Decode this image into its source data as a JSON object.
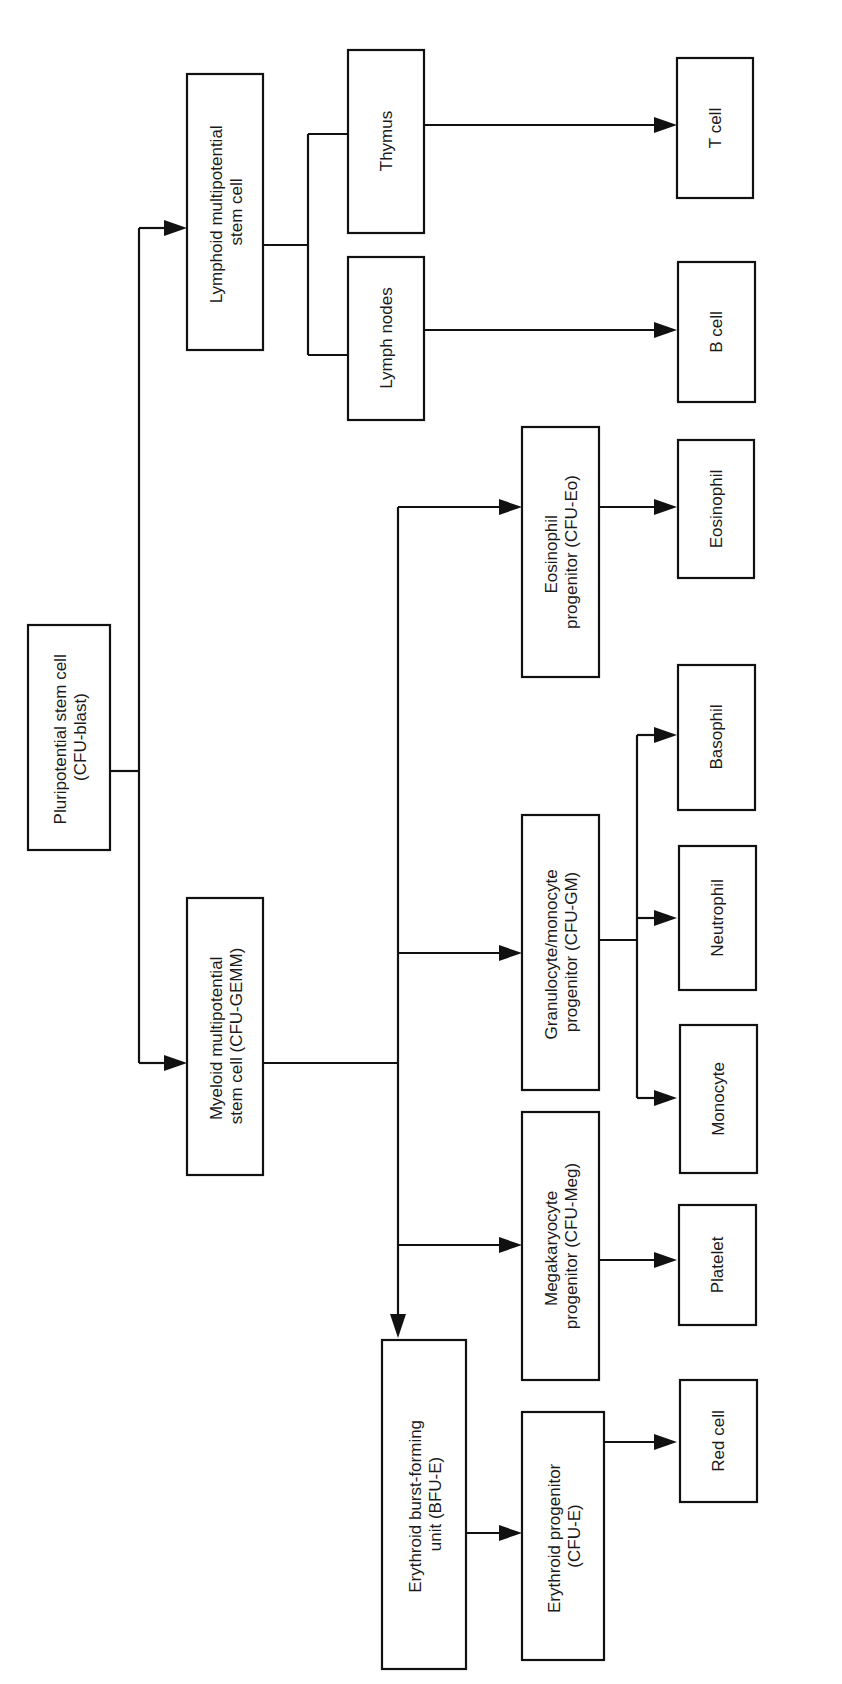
{
  "diagram": {
    "orientation": "rotated-90-ccw",
    "line_color": "#111111",
    "background": "#ffffff",
    "nodes": {
      "pluripotential": {
        "line1": "Pluripotential stem cell",
        "line2": "(CFU-blast)"
      },
      "lymphoid": {
        "line1": "Lymphoid multipotential",
        "line2": "stem cell"
      },
      "myeloid": {
        "line1": "Myeloid multipotential",
        "line2": "stem cell (CFU-GEMM)"
      },
      "thymus": {
        "line1": "Thymus"
      },
      "lymph_nodes": {
        "line1": "Lymph nodes"
      },
      "eosinophil_progenitor": {
        "line1": "Eosinophil",
        "line2": "progenitor (CFU-Eo)"
      },
      "granulocyte_monocyte_progenitor": {
        "line1": "Granulocyte/monocyte",
        "line2": "progenitor (CFU-GM)"
      },
      "megakaryocyte_progenitor": {
        "line1": "Megakaryocyte",
        "line2": "progenitor (CFU-Meg)"
      },
      "bfu_e": {
        "line1": "Erythroid burst-forming",
        "line2": "unit (BFU-E)"
      },
      "cfu_e": {
        "line1": "Erythroid progenitor",
        "line2": "(CFU-E)"
      },
      "t_cell": {
        "line1": "T cell"
      },
      "b_cell": {
        "line1": "B cell"
      },
      "eosinophil": {
        "line1": "Eosinophil"
      },
      "basophil": {
        "line1": "Basophil"
      },
      "neutrophil": {
        "line1": "Neutrophil"
      },
      "monocyte": {
        "line1": "Monocyte"
      },
      "platelet": {
        "line1": "Platelet"
      },
      "red_cell": {
        "line1": "Red cell"
      }
    },
    "edges": [
      [
        "pluripotential",
        "lymphoid"
      ],
      [
        "pluripotential",
        "myeloid"
      ],
      [
        "lymphoid",
        "thymus"
      ],
      [
        "lymphoid",
        "lymph_nodes"
      ],
      [
        "thymus",
        "t_cell"
      ],
      [
        "lymph_nodes",
        "b_cell"
      ],
      [
        "myeloid",
        "eosinophil_progenitor"
      ],
      [
        "myeloid",
        "granulocyte_monocyte_progenitor"
      ],
      [
        "myeloid",
        "megakaryocyte_progenitor"
      ],
      [
        "myeloid",
        "bfu_e"
      ],
      [
        "eosinophil_progenitor",
        "eosinophil"
      ],
      [
        "granulocyte_monocyte_progenitor",
        "basophil"
      ],
      [
        "granulocyte_monocyte_progenitor",
        "neutrophil"
      ],
      [
        "granulocyte_monocyte_progenitor",
        "monocyte"
      ],
      [
        "megakaryocyte_progenitor",
        "platelet"
      ],
      [
        "bfu_e",
        "cfu_e"
      ],
      [
        "cfu_e",
        "red_cell"
      ]
    ]
  }
}
